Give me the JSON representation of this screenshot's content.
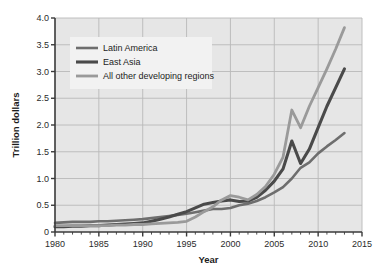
{
  "chart_data": {
    "type": "line",
    "title": "",
    "subtitle": "",
    "xlabel": "Year",
    "ylabel": "Trillion dollars",
    "xlim": [
      1980,
      2015
    ],
    "ylim": [
      0,
      4.0
    ],
    "grid": true,
    "legend_position": "upper-left",
    "x_ticks": [
      1980,
      1985,
      1990,
      1995,
      2000,
      2005,
      2010,
      2015
    ],
    "x_tick_labels": [
      "1980",
      "1985",
      "1990",
      "1995",
      "2000",
      "2005",
      "2010",
      "2015"
    ],
    "x_minor_tick_interval": 1,
    "y_ticks": [
      0,
      0.5,
      1.0,
      1.5,
      2.0,
      2.5,
      3.0,
      3.5,
      4.0
    ],
    "y_tick_labels": [
      "0",
      "0.5",
      "1.0",
      "1.5",
      "2.0",
      "2.5",
      "3.0",
      "3.5",
      "4.0"
    ],
    "x": [
      1980,
      1981,
      1982,
      1983,
      1984,
      1985,
      1986,
      1987,
      1988,
      1989,
      1990,
      1991,
      1992,
      1993,
      1994,
      1995,
      1996,
      1997,
      1998,
      1999,
      2000,
      2001,
      2002,
      2003,
      2004,
      2005,
      2006,
      2007,
      2008,
      2009,
      2010,
      2011,
      2012,
      2013
    ],
    "series": [
      {
        "name": "Latin America",
        "color": "#6e6e6e",
        "line_width": 2.6,
        "final_value": 1.85,
        "values": [
          0.17,
          0.18,
          0.19,
          0.19,
          0.19,
          0.2,
          0.2,
          0.21,
          0.22,
          0.23,
          0.24,
          0.26,
          0.28,
          0.3,
          0.32,
          0.34,
          0.37,
          0.4,
          0.43,
          0.43,
          0.45,
          0.5,
          0.53,
          0.58,
          0.65,
          0.74,
          0.84,
          1.0,
          1.2,
          1.3,
          1.47,
          1.6,
          1.72,
          1.85
        ]
      },
      {
        "name": "East Asia",
        "color": "#4a4a4a",
        "line_width": 3.1,
        "final_value": 3.05,
        "values": [
          0.1,
          0.1,
          0.11,
          0.11,
          0.12,
          0.12,
          0.13,
          0.14,
          0.15,
          0.16,
          0.17,
          0.2,
          0.24,
          0.28,
          0.33,
          0.38,
          0.45,
          0.52,
          0.55,
          0.58,
          0.6,
          0.57,
          0.58,
          0.65,
          0.78,
          0.95,
          1.18,
          1.7,
          1.28,
          1.55,
          1.95,
          2.35,
          2.7,
          3.05
        ]
      },
      {
        "name": "All other developing regions",
        "color": "#9a9a9a",
        "line_width": 2.8,
        "final_value": 3.82,
        "values": [
          0.12,
          0.12,
          0.12,
          0.12,
          0.12,
          0.12,
          0.12,
          0.13,
          0.13,
          0.14,
          0.14,
          0.15,
          0.16,
          0.17,
          0.18,
          0.2,
          0.28,
          0.38,
          0.47,
          0.6,
          0.68,
          0.65,
          0.6,
          0.7,
          0.85,
          1.08,
          1.4,
          2.28,
          1.95,
          2.35,
          2.7,
          3.05,
          3.42,
          3.82
        ]
      }
    ],
    "annotations": []
  },
  "figure": {
    "background_color": "#ffffff",
    "plot_background_color": "#e6e6e6",
    "gridline_color": "#b9b9b9",
    "axis_color": "#3a3a3a",
    "legend_background_color": "#f2f2f2"
  }
}
